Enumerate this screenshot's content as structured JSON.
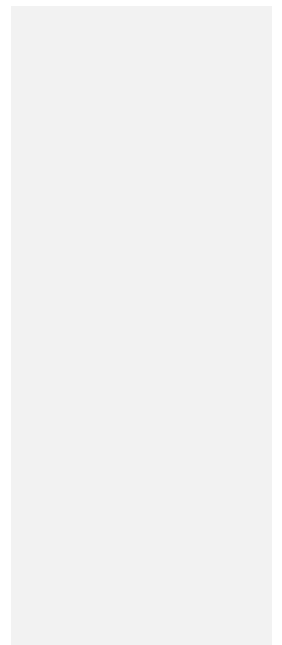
{
  "view": {
    "title": "Grayscale Cell Grid",
    "width": 282,
    "height": 645,
    "background_color": "#ffffff"
  },
  "grid": {
    "origin_x": 11,
    "origin_y": 6,
    "columns": 29,
    "rows": 71,
    "cell_width": 9,
    "cell_height": 9,
    "gridline_width": 1,
    "gridline_color": "#e8e8e8",
    "palette": [
      "#000000",
      "#0d0d0d",
      "#1a1a1a",
      "#333333",
      "#4d4d4d",
      "#666666",
      "#808080",
      "#999999",
      "#b3b3b3",
      "#cccccc"
    ],
    "pattern": {
      "type": "staggered-blob-lattice",
      "blob_spacing_x": 7,
      "blob_spacing_y": 7,
      "blob_stagger_x": 3.5,
      "blob_radius": 3.2,
      "band_dark_top_rows": 6,
      "band_dark_bottom_rows": 6,
      "band_dark_level": 1,
      "noise_amount": 0.45,
      "seed": 20240617
    }
  },
  "selection": {
    "label": "selection-rectangle",
    "color": "#ffffff",
    "stroke_width": 2,
    "left": 147,
    "top": 132,
    "width": 116,
    "height": 160,
    "left_edge_height": 158,
    "right_edge_height": 163,
    "open_bottom": true
  },
  "chart_data": {
    "type": "heatmap",
    "xlabel": "",
    "ylabel": "",
    "columns": 29,
    "rows": 71,
    "value_range": [
      0,
      9
    ],
    "colormap": "gray",
    "legend": "none",
    "grid": true,
    "annotations": [
      {
        "kind": "rectangle",
        "name": "selection-rectangle",
        "color": "#ffffff",
        "col_start": 15,
        "col_end": 28,
        "row_start": 14,
        "row_end": 32
      }
    ]
  }
}
